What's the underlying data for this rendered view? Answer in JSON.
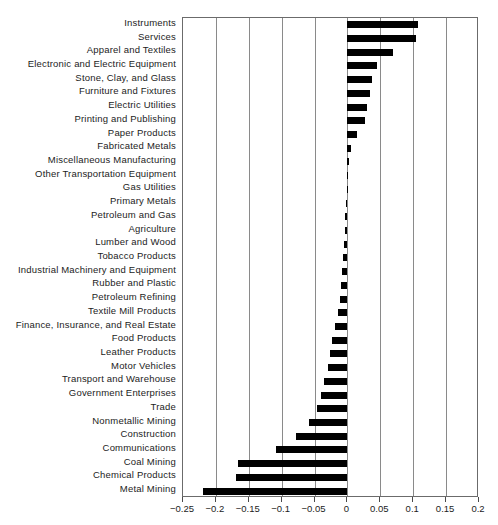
{
  "chart_data": {
    "type": "bar",
    "orientation": "horizontal",
    "title": "",
    "xlabel": "",
    "ylabel": "",
    "xlim": [
      -0.25,
      0.2
    ],
    "xticks": [
      -0.25,
      -0.2,
      -0.15,
      -0.1,
      -0.05,
      0,
      0.05,
      0.1,
      0.15,
      0.2
    ],
    "xticklabels": [
      "−0.25",
      "−0.2",
      "−0.15",
      "−0.1",
      "−0.05",
      "0",
      "0.05",
      "0.1",
      "0.15",
      "0.2"
    ],
    "grid": true,
    "grid_axis": "x",
    "legend": false,
    "bar_color": "#000000",
    "categories": [
      "Instruments",
      "Services",
      "Apparel and Textiles",
      "Electronic and Electric Equipment",
      "Stone, Clay, and Glass",
      "Furniture and Fixtures",
      "Electric Utilities",
      "Printing and Publishing",
      "Paper Products",
      "Fabricated Metals",
      "Miscellaneous Manufacturing",
      "Other Transportation Equipment",
      "Gas Utilities",
      "Primary Metals",
      "Petroleum and Gas",
      "Agriculture",
      "Lumber and Wood",
      "Tobacco Products",
      "Industrial Machinery and Equipment",
      "Rubber and Plastic",
      "Petroleum Refining",
      "Textile Mill Products",
      "Finance, Insurance, and Real Estate",
      "Food Products",
      "Leather Products",
      "Motor Vehicles",
      "Transport and Warehouse",
      "Government Enterprises",
      "Trade",
      "Nonmetallic Mining",
      "Construction",
      "Communications",
      "Coal Mining",
      "Chemical Products",
      "Metal Mining"
    ],
    "values": [
      0.107,
      0.104,
      0.07,
      0.045,
      0.038,
      0.035,
      0.03,
      0.027,
      0.015,
      0.006,
      0.002,
      0.001,
      -0.001,
      -0.002,
      -0.003,
      -0.004,
      -0.005,
      -0.006,
      -0.008,
      -0.01,
      -0.012,
      -0.015,
      -0.019,
      -0.023,
      -0.026,
      -0.03,
      -0.035,
      -0.04,
      -0.046,
      -0.058,
      -0.078,
      -0.109,
      -0.166,
      -0.17,
      -0.219
    ]
  }
}
